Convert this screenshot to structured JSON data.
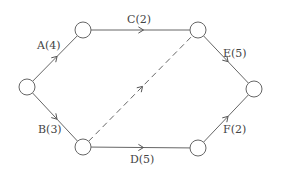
{
  "diagram": {
    "type": "activity-on-arrow network",
    "nodes": [
      {
        "id": "n1",
        "name": "start"
      },
      {
        "id": "n2",
        "name": "top-left"
      },
      {
        "id": "n3",
        "name": "top-right"
      },
      {
        "id": "n4",
        "name": "bottom-left"
      },
      {
        "id": "n5",
        "name": "bottom-right"
      },
      {
        "id": "n6",
        "name": "end"
      }
    ],
    "edges": [
      {
        "id": "A",
        "from": "n1",
        "to": "n2",
        "label": "A(4)",
        "activity": "A",
        "duration": 4,
        "style": "solid"
      },
      {
        "id": "B",
        "from": "n1",
        "to": "n4",
        "label": "B(3)",
        "activity": "B",
        "duration": 3,
        "style": "solid"
      },
      {
        "id": "C",
        "from": "n2",
        "to": "n3",
        "label": "C(2)",
        "activity": "C",
        "duration": 2,
        "style": "solid"
      },
      {
        "id": "D",
        "from": "n4",
        "to": "n5",
        "label": "D(5)",
        "activity": "D",
        "duration": 5,
        "style": "solid"
      },
      {
        "id": "dummy",
        "from": "n4",
        "to": "n3",
        "label": "",
        "activity": "dummy",
        "duration": 0,
        "style": "dashed"
      },
      {
        "id": "E",
        "from": "n3",
        "to": "n6",
        "label": "E(5)",
        "activity": "E",
        "duration": 5,
        "style": "solid"
      },
      {
        "id": "F",
        "from": "n5",
        "to": "n6",
        "label": "F(2)",
        "activity": "F",
        "duration": 2,
        "style": "solid"
      }
    ],
    "colors": {
      "line": "#666666",
      "text": "#444444",
      "background": "#ffffff"
    }
  }
}
